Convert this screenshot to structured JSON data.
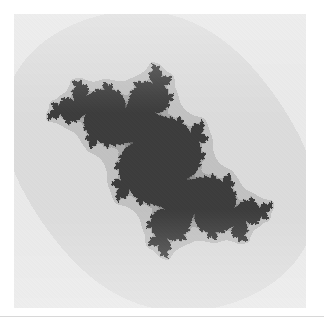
{
  "figure": {
    "title": "",
    "caption": "",
    "alt_label": "julia-set-fractal"
  },
  "canvas": {
    "x": 14,
    "y": 14,
    "width": 292,
    "height": 294
  },
  "separator": {
    "y": 316,
    "color": "#d8d8d8"
  },
  "palette": {
    "background": "#ffffff",
    "light": "#f2f2f2",
    "light_mid": "#dcdcdc",
    "mid": "#a0a0a0",
    "mid_dark": "#8a8a8a",
    "dark": "#4a4a4a",
    "darkest": "#3d3d3d"
  },
  "chart_data": {
    "type": "heatmap",
    "title": "",
    "subtitle": "",
    "xlabel": "",
    "ylabel": "",
    "render": "escape-time-julia",
    "formula": "z -> z^2 + c",
    "c_real": -0.1,
    "c_imag": 0.651,
    "max_iterations": 40,
    "xlim": [
      -1.62,
      1.62
    ],
    "ylim": [
      -1.62,
      1.62
    ],
    "grid": false,
    "legend": null,
    "pixel_width": 292,
    "pixel_height": 294,
    "colormap_stops": [
      {
        "t": 0.0,
        "hex": "#f2f2f2"
      },
      {
        "t": 0.25,
        "hex": "#e2e2e2"
      },
      {
        "t": 0.5,
        "hex": "#b4b4b4"
      },
      {
        "t": 0.72,
        "hex": "#8e8e8e"
      },
      {
        "t": 0.88,
        "hex": "#5a5a5a"
      },
      {
        "t": 1.0,
        "hex": "#3d3d3d"
      }
    ],
    "vertical_shading": {
      "enabled": true,
      "description": "bands lighten toward top and bottom edges",
      "top_lighten": 0.42,
      "center_lighten": 0.0,
      "bottom_lighten": 0.45
    },
    "annotations": []
  }
}
